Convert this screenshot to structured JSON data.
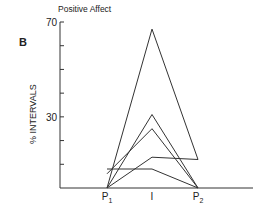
{
  "panel_label": "B",
  "chart_data": {
    "type": "line",
    "title": "Positive Affect",
    "xlabel": "",
    "ylabel": "% INTERVALS",
    "categories": [
      "P1",
      "I",
      "P2"
    ],
    "category_labels": [
      {
        "main": "P",
        "sub": "1"
      },
      {
        "main": "I",
        "sub": ""
      },
      {
        "main": "P",
        "sub": "2"
      }
    ],
    "ylim": [
      0,
      70
    ],
    "yticks": [
      0,
      10,
      20,
      30,
      40,
      50,
      60,
      70
    ],
    "ytick_labels": [
      {
        "value": 30,
        "label": "30"
      },
      {
        "value": 70,
        "label": "70"
      }
    ],
    "grid": false,
    "series": [
      {
        "name": "subject-1",
        "values": [
          0,
          67,
          12
        ]
      },
      {
        "name": "subject-2",
        "values": [
          0,
          31,
          0
        ]
      },
      {
        "name": "subject-3",
        "values": [
          6,
          25,
          0
        ]
      },
      {
        "name": "subject-4",
        "values": [
          0,
          13,
          12
        ]
      },
      {
        "name": "subject-5",
        "values": [
          8,
          8,
          0
        ]
      }
    ],
    "line_color": "#333333"
  }
}
